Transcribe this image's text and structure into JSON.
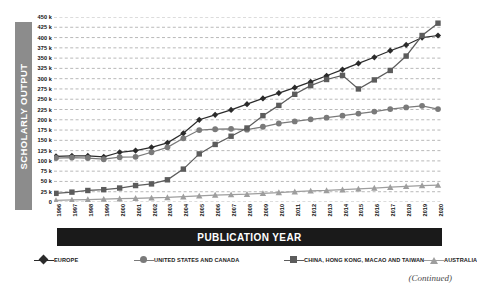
{
  "figure": {
    "continued_note": "(Continued)",
    "background": "#ffffff"
  },
  "axis_titles": {
    "y": "SCHOLARLY OUTPUT",
    "x": "PUBLICATION YEAR",
    "y_bar_color": "#8c8c8c",
    "x_bar_color": "#1a1a1a"
  },
  "chart_data": {
    "type": "line",
    "title": "",
    "xlabel": "PUBLICATION YEAR",
    "ylabel": "SCHOLARLY OUTPUT",
    "grid": true,
    "legend_position": "bottom",
    "xlim": [
      1996,
      2020
    ],
    "ylim": [
      0,
      450000
    ],
    "ytick_values": [
      0,
      25000,
      50000,
      75000,
      100000,
      125000,
      150000,
      175000,
      200000,
      225000,
      250000,
      275000,
      300000,
      325000,
      350000,
      375000,
      400000,
      425000,
      450000
    ],
    "ytick_labels": [
      "0",
      "25 k",
      "50 k",
      "75 k",
      "100 k",
      "125 k",
      "150 k",
      "175 k",
      "200 k",
      "225 k",
      "250 k",
      "275 k",
      "300 k",
      "325 k",
      "350 k",
      "375 k",
      "400 k",
      "425 k",
      "450 k"
    ],
    "categories": [
      "1996",
      "1997",
      "1998",
      "1999",
      "2000",
      "2001",
      "2002",
      "2003",
      "2004",
      "2005",
      "2006",
      "2007",
      "2008",
      "2009",
      "2010",
      "2011",
      "2012",
      "2013",
      "2014",
      "2015",
      "2016",
      "2017",
      "2018",
      "2019",
      "2020"
    ],
    "series": [
      {
        "name": "EUROPE",
        "marker": "diamond",
        "color": "#2b2b2b",
        "values": [
          111000,
          112000,
          112000,
          110000,
          121000,
          125000,
          133000,
          144000,
          167000,
          200000,
          212000,
          224000,
          238000,
          252000,
          265000,
          278000,
          292000,
          307000,
          322000,
          337000,
          352000,
          368000,
          382000,
          400000,
          405000
        ]
      },
      {
        "name": "UNITED STATES AND CANADA",
        "marker": "circle",
        "color": "#7a7a7a",
        "values": [
          107000,
          108000,
          107000,
          104000,
          109000,
          110000,
          121000,
          133000,
          155000,
          175000,
          177000,
          178000,
          176000,
          183000,
          191000,
          196000,
          201000,
          205000,
          210000,
          215000,
          220000,
          226000,
          230000,
          234000,
          226000
        ]
      },
      {
        "name": "CHINA, HONG KONG, MACAO AND TAIWAN",
        "marker": "square",
        "color": "#5c5c5c",
        "values": [
          21000,
          24000,
          28000,
          30000,
          34000,
          40000,
          44000,
          54000,
          80000,
          117000,
          140000,
          160000,
          180000,
          210000,
          235000,
          262000,
          283000,
          298000,
          308000,
          275000,
          297000,
          320000,
          355000,
          405000,
          435000
        ]
      },
      {
        "name": "AUSTRALIA",
        "marker": "triangle",
        "color": "#9e9e9e",
        "values": [
          4000,
          5000,
          6000,
          7000,
          8000,
          9000,
          10000,
          11000,
          13000,
          15000,
          17000,
          18000,
          19000,
          21000,
          23000,
          25000,
          27000,
          28000,
          30000,
          32000,
          34000,
          36000,
          38000,
          40000,
          41000
        ]
      }
    ]
  }
}
